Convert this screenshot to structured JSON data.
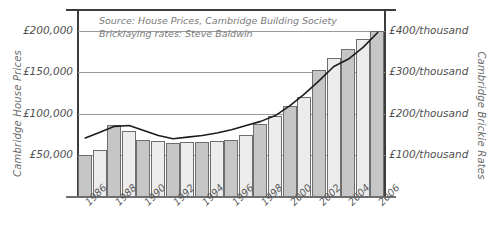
{
  "chart_data": {
    "type": "bar",
    "title": "",
    "subtitle": "",
    "annotations": [
      "Source: House Prices, Cambridge Building Society",
      "Bricklaying rates: Steve Baldwin"
    ],
    "xlabel": "",
    "ylabel": "Cambridge House Prices",
    "y2label": "Cambridge Brickie Rates",
    "grid": true,
    "legend": "none",
    "x": [
      1986,
      1987,
      1988,
      1989,
      1990,
      1991,
      1992,
      1993,
      1994,
      1995,
      1996,
      1997,
      1998,
      1999,
      2000,
      2001,
      2002,
      2003,
      2004,
      2005,
      2006
    ],
    "x_tick_labels": [
      "1986",
      "1988",
      "1990",
      "1992",
      "1994",
      "1996",
      "1998",
      "2000",
      "2002",
      "2004",
      "2006"
    ],
    "ylim": [
      0,
      225000
    ],
    "y_tick_labels": [
      "£50,000",
      "£100,000",
      "£150,000",
      "£200,000"
    ],
    "y_ticks": [
      50000,
      100000,
      150000,
      200000
    ],
    "y2lim": [
      0,
      450
    ],
    "y2_tick_labels": [
      "£100/thousand",
      "£200/thousand",
      "£300/thousand",
      "£400/thousand"
    ],
    "y2_ticks": [
      100,
      200,
      300,
      400
    ],
    "series": [
      {
        "name": "Cambridge Brickie Rates",
        "type": "bar",
        "axis": "right",
        "unit": "£/thousand",
        "values": [
          100,
          113,
          174,
          159,
          137,
          136,
          130,
          132,
          133,
          136,
          138,
          149,
          176,
          195,
          220,
          240,
          305,
          334,
          357,
          380,
          400
        ]
      },
      {
        "name": "Cambridge House Prices",
        "type": "line",
        "axis": "left",
        "unit": "£",
        "values": [
          71000,
          78000,
          85000,
          86000,
          80000,
          74000,
          70000,
          72000,
          74000,
          77000,
          81000,
          86000,
          91000,
          98000,
          110000,
          124000,
          140000,
          157000,
          166000,
          180000,
          198000
        ]
      }
    ]
  },
  "style": {
    "bar_fill_light": "#ececec",
    "bar_fill_dark": "#c6c6c6",
    "bar_stroke": "#6e6e6e",
    "line_color": "#1c1c1c",
    "grid_color": "#9a9a9a",
    "axis_color": "#3c3c3c",
    "text_color": "#5a5a5a"
  }
}
